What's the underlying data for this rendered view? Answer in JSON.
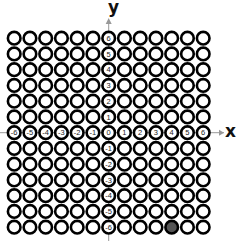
{
  "diagram": {
    "type": "coordinate-grid-of-circles",
    "x_axis_label": "x",
    "y_axis_label": "y",
    "x_min": -6,
    "x_max": 6,
    "y_min": -6,
    "y_max": 6,
    "x_axis_ticks": [
      "-6",
      "-5",
      "-4",
      "-3",
      "-2",
      "-1",
      "0",
      "1",
      "2",
      "3",
      "4",
      "5",
      "6"
    ],
    "y_axis_ticks": [
      "6",
      "5",
      "4",
      "3",
      "2",
      "1",
      "0",
      "-1",
      "-2",
      "-3",
      "-4",
      "-5",
      "-6"
    ],
    "filled_points": [
      {
        "x": 4,
        "y": -6
      }
    ],
    "colors": {
      "ring": "#000000",
      "fill_empty": "#ffffff",
      "fill_selected": "#555555",
      "axis": "#999999",
      "tick_text": "#222222"
    }
  }
}
